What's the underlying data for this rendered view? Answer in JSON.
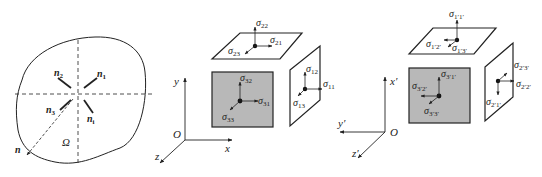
{
  "colors": {
    "ink": "#222222",
    "face_fill": "#b8b8b8",
    "background": "#ffffff"
  },
  "panel_domain": {
    "region_label": "Ω",
    "normals": [
      {
        "sym": "n",
        "sub": "1"
      },
      {
        "sym": "n",
        "sub": "2"
      },
      {
        "sym": "n",
        "sub": "3"
      },
      {
        "sym": "n",
        "sub": "i"
      }
    ],
    "outward_normal": "n"
  },
  "panel_original": {
    "axes": {
      "origin": "O",
      "x": "x",
      "y": "y",
      "z": "z"
    },
    "top_face": [
      {
        "sym": "σ",
        "sub": "22"
      },
      {
        "sym": "σ",
        "sub": "21"
      },
      {
        "sym": "σ",
        "sub": "23"
      }
    ],
    "front_face": [
      {
        "sym": "σ",
        "sub": "32"
      },
      {
        "sym": "σ",
        "sub": "31"
      },
      {
        "sym": "σ",
        "sub": "33"
      }
    ],
    "side_face": [
      {
        "sym": "σ",
        "sub": "12"
      },
      {
        "sym": "σ",
        "sub": "11"
      },
      {
        "sym": "σ",
        "sub": "13"
      }
    ]
  },
  "panel_transformed": {
    "axes": {
      "origin": "O",
      "x": "x′",
      "y": "y′",
      "z": "z′"
    },
    "top_face": [
      {
        "sym": "σ",
        "sub": "1′1′"
      },
      {
        "sym": "σ",
        "sub": "1′2′"
      },
      {
        "sym": "σ",
        "sub": "1′3′"
      }
    ],
    "front_face": [
      {
        "sym": "σ",
        "sub": "3′1′"
      },
      {
        "sym": "σ",
        "sub": "3′2′"
      },
      {
        "sym": "σ",
        "sub": "3′3′"
      }
    ],
    "side_face": [
      {
        "sym": "σ",
        "sub": "2′3′"
      },
      {
        "sym": "σ",
        "sub": "2′2′"
      },
      {
        "sym": "σ",
        "sub": "2′1′"
      }
    ]
  }
}
